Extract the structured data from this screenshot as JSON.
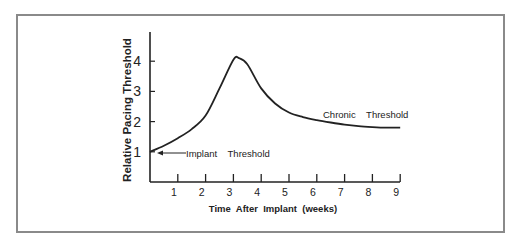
{
  "chart_data": {
    "type": "line",
    "title": "",
    "xlabel": "Time  After  Implant  (weeks)",
    "ylabel": "Relative Pacing Threshold",
    "x_ticks": [
      "1",
      "2",
      "3",
      "4",
      "5",
      "6",
      "7",
      "8",
      "9"
    ],
    "y_ticks": [
      "1",
      "2",
      "3",
      "4"
    ],
    "xlim": [
      0,
      9
    ],
    "ylim": [
      0,
      5
    ],
    "grid": false,
    "legend": null,
    "series": [
      {
        "name": "Pacing threshold",
        "x": [
          0,
          0.5,
          1,
          1.5,
          2,
          2.5,
          3,
          3.2,
          3.5,
          4,
          4.5,
          5,
          5.5,
          6,
          6.5,
          7,
          7.5,
          8,
          8.5,
          9
        ],
        "y": [
          1.0,
          1.2,
          1.45,
          1.75,
          2.2,
          3.1,
          4.05,
          4.1,
          3.9,
          3.1,
          2.6,
          2.3,
          2.15,
          2.05,
          1.97,
          1.9,
          1.85,
          1.82,
          1.8,
          1.8
        ]
      }
    ],
    "annotations": [
      {
        "text": "Implant    Threshold",
        "x": 0.35,
        "y": 1.0,
        "arrow_to": [
          0.1,
          1.0
        ]
      },
      {
        "text": "Chronic    Threshold",
        "x": 6.2,
        "y": 2.15
      }
    ]
  }
}
